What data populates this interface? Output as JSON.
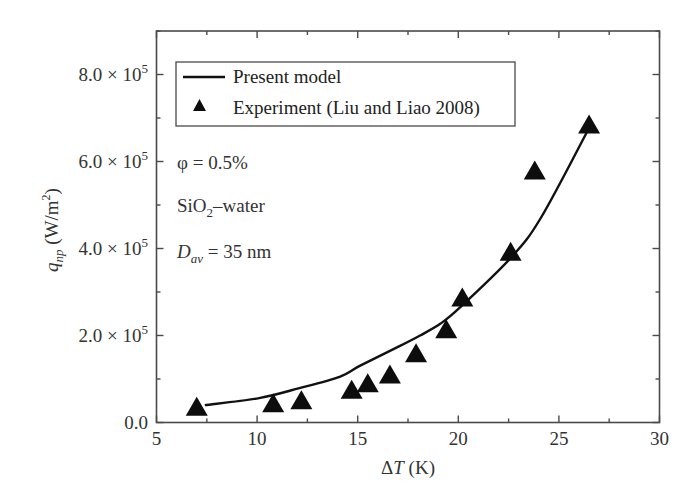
{
  "chart_data": {
    "type": "scatter",
    "title": "",
    "xlabel": "ΔT (K)",
    "ylabel": "q_np (W/m²)",
    "xlim": [
      5,
      30
    ],
    "ylim": [
      0,
      900000
    ],
    "x_ticks": [
      5,
      10,
      15,
      20,
      25,
      30
    ],
    "x_tick_labels": [
      "5",
      "10",
      "15",
      "20",
      "25",
      "30"
    ],
    "y_ticks": [
      0,
      200000,
      400000,
      600000,
      800000
    ],
    "y_tick_labels": [
      "0.0",
      "2.0 × 10⁵",
      "4.0 × 10⁵",
      "6.0 × 10⁵",
      "8.0 × 10⁵"
    ],
    "grid": false,
    "legend_position": "upper left",
    "legend": [
      "Present model",
      "Experiment (Liu and Liao 2008)"
    ],
    "annotations": [
      "φ = 0.5%",
      "SiO₂–water",
      "D_av = 35 nm"
    ],
    "series": [
      {
        "name": "Present model",
        "type": "line",
        "x": [
          7.4,
          10.1,
          12.1,
          14.1,
          15.1,
          17.1,
          18.1,
          19.1,
          20.1,
          22.6,
          24.1,
          26.5
        ],
        "y": [
          40000,
          56000,
          79000,
          105000,
          130000,
          176000,
          200000,
          227000,
          265000,
          378000,
          470000,
          677000
        ]
      },
      {
        "name": "Experiment (Liu and Liao 2008)",
        "type": "scatter",
        "marker": "triangle",
        "x": [
          7.0,
          10.8,
          12.2,
          14.7,
          15.5,
          16.6,
          17.9,
          19.4,
          20.2,
          22.6,
          23.8,
          26.5
        ],
        "y": [
          34000,
          42000,
          49000,
          73000,
          88000,
          108000,
          157000,
          212000,
          285000,
          390000,
          577000,
          683000
        ]
      }
    ]
  },
  "axes": {
    "x_title_main": "Δ",
    "x_title_var": "T",
    "x_title_unit": " (K)",
    "y_title_var": "q",
    "y_title_sub": "np",
    "y_title_unit": " (W/m",
    "y_title_sup": "2",
    "y_title_close": ")",
    "y_tick_mant": [
      "0.0",
      "2.0 × 10",
      "4.0 × 10",
      "6.0 × 10",
      "8.0 × 10"
    ],
    "y_tick_exp": [
      "",
      "5",
      "5",
      "5",
      "5"
    ]
  },
  "legend": {
    "line_label": "Present model",
    "marker_label": "Experiment (Liu and Liao 2008)"
  },
  "annotations": {
    "phi": "φ = 0.5%",
    "fluid_main": "SiO",
    "fluid_sub": "2",
    "fluid_rest": "–water",
    "d_var": "D",
    "d_sub": "av",
    "d_rest": " = 35 nm"
  },
  "colors": {
    "axis": "#4a4a4a",
    "line": "#111111",
    "marker": "#0d0d0d"
  }
}
